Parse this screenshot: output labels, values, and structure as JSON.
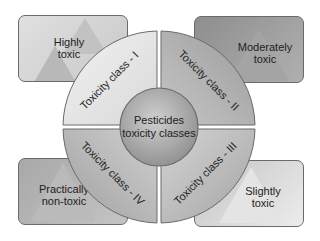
{
  "diagram": {
    "center": {
      "line1": "Pesticides",
      "line2": "toxicity classes"
    },
    "quadrants": [
      {
        "label": "Toxicity class - I",
        "position": "top-left"
      },
      {
        "label": "Toxicity class - II",
        "position": "top-right"
      },
      {
        "label": "Toxicity class - III",
        "position": "bottom-right"
      },
      {
        "label": "Toxicity class - IV",
        "position": "bottom-left"
      }
    ],
    "boxes": [
      {
        "line1": "Highly",
        "line2": "toxic",
        "icon": "skull-crossbones-biohazard-icon"
      },
      {
        "line1": "Moderately",
        "line2": "toxic",
        "icon": "warning-triangle-icon"
      },
      {
        "line1": "Slightly",
        "line2": "toxic",
        "icon": "biohazard-triangle-icon"
      },
      {
        "line1": "Practically",
        "line2": "non-toxic",
        "icon": "warning-triangle-icon"
      }
    ],
    "colors": {
      "box_highly": "#d6d6d6",
      "box_moderately": "#9a9a9a",
      "box_slightly": "#dcdcdc",
      "box_practically": "#b4b4b4",
      "ring_light": "#e6e6e6",
      "ring_dark": "#a8a8a8",
      "center": "#b0b0b0",
      "border": "#6a6a6a"
    }
  }
}
